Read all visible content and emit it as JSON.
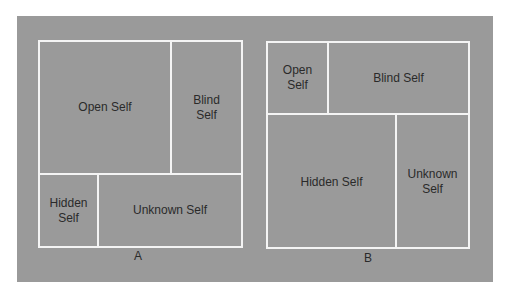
{
  "diagrams": {
    "a": {
      "caption": "A",
      "open": "Open Self",
      "blind": "Blind\nSelf",
      "hidden": "Hidden\nSelf",
      "unknown": "Unknown Self"
    },
    "b": {
      "caption": "B",
      "open": "Open\nSelf",
      "blind": "Blind Self",
      "hidden": "Hidden Self",
      "unknown": "Unknown\nSelf"
    }
  },
  "colors": {
    "panel": "#9a9a9a",
    "lines": "#f4f4f4",
    "text": "#2a2a2a"
  }
}
